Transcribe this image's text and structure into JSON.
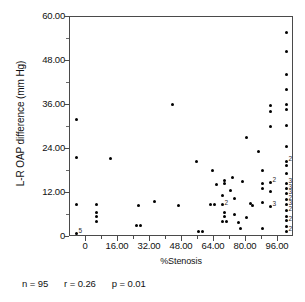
{
  "figure": {
    "title": "",
    "stats": {
      "n_label": "n = 95",
      "r_label": "r = 0.26",
      "p_label": "p = 0.01"
    }
  },
  "chart_data": {
    "type": "scatter",
    "title": "",
    "xlabel": "%Stenosis",
    "ylabel": "L-R OAP difference (mm Hg)",
    "xlim": [
      -8,
      104
    ],
    "ylim": [
      0,
      60
    ],
    "grid": false,
    "legend": "none",
    "xticks": [
      0,
      16,
      32,
      48,
      64,
      80,
      96
    ],
    "xtick_labels": [
      "0",
      "16.00",
      "32.00",
      "48.00",
      "64.00",
      "80.00",
      "96.00"
    ],
    "yticks": [
      0,
      12,
      24,
      36,
      48,
      60
    ],
    "ytick_labels": [
      "0",
      "12.00",
      "24.00",
      "36.00",
      "48.00",
      "60.00"
    ],
    "n": 95,
    "r": 0.26,
    "p": 0.01,
    "points": [
      {
        "x": -5,
        "y": 32.0
      },
      {
        "x": -5,
        "y": 21.6
      },
      {
        "x": -5,
        "y": 8.8
      },
      {
        "x": -5,
        "y": 1.0,
        "count": 5,
        "label": "5"
      },
      {
        "x": 5,
        "y": 9.0
      },
      {
        "x": 5,
        "y": 6.8
      },
      {
        "x": 5,
        "y": 5.6
      },
      {
        "x": 5,
        "y": 4.2
      },
      {
        "x": 12,
        "y": 21.5
      },
      {
        "x": 26,
        "y": 8.6
      },
      {
        "x": 25,
        "y": 3.2
      },
      {
        "x": 27,
        "y": 3.2
      },
      {
        "x": 34,
        "y": 9.8
      },
      {
        "x": 43,
        "y": 36.1
      },
      {
        "x": 46,
        "y": 8.6
      },
      {
        "x": 55,
        "y": 20.5
      },
      {
        "x": 56,
        "y": 1.5
      },
      {
        "x": 58,
        "y": 1.5
      },
      {
        "x": 62,
        "y": 8.8
      },
      {
        "x": 64,
        "y": 8.8
      },
      {
        "x": 63,
        "y": 18.2
      },
      {
        "x": 65,
        "y": 14.2
      },
      {
        "x": 69,
        "y": 15.4
      },
      {
        "x": 69,
        "y": 14.6
      },
      {
        "x": 68,
        "y": 11.4
      },
      {
        "x": 68,
        "y": 8.8,
        "count": 2,
        "label": "2"
      },
      {
        "x": 69,
        "y": 6.6
      },
      {
        "x": 69,
        "y": 5.6
      },
      {
        "x": 68,
        "y": 4.2
      },
      {
        "x": 70,
        "y": 4.2
      },
      {
        "x": 72,
        "y": 12.8
      },
      {
        "x": 73,
        "y": 16.2
      },
      {
        "x": 74,
        "y": 10.4
      },
      {
        "x": 74,
        "y": 6.2
      },
      {
        "x": 76,
        "y": 4.0
      },
      {
        "x": 77,
        "y": 2.2
      },
      {
        "x": 78,
        "y": 15.2
      },
      {
        "x": 80,
        "y": 27.2
      },
      {
        "x": 80,
        "y": 5.2
      },
      {
        "x": 82,
        "y": 9.2
      },
      {
        "x": 83,
        "y": 8.6
      },
      {
        "x": 86,
        "y": 23.4
      },
      {
        "x": 88,
        "y": 18.2
      },
      {
        "x": 88,
        "y": 14.6
      },
      {
        "x": 88,
        "y": 13.2
      },
      {
        "x": 88,
        "y": 9.4
      },
      {
        "x": 88,
        "y": 2.2
      },
      {
        "x": 92,
        "y": 35.8
      },
      {
        "x": 92,
        "y": 34.2
      },
      {
        "x": 92,
        "y": 30.2
      },
      {
        "x": 92,
        "y": 15.0,
        "count": 2,
        "label": "2"
      },
      {
        "x": 92,
        "y": 12.4
      },
      {
        "x": 92,
        "y": 8.4,
        "count": 3,
        "label": "3"
      },
      {
        "x": 100,
        "y": 55.8
      },
      {
        "x": 100,
        "y": 50.6
      },
      {
        "x": 100,
        "y": 44.4
      },
      {
        "x": 100,
        "y": 40.2
      },
      {
        "x": 100,
        "y": 36.2
      },
      {
        "x": 100,
        "y": 34.8
      },
      {
        "x": 100,
        "y": 30.4
      },
      {
        "x": 100,
        "y": 24.6
      },
      {
        "x": 100,
        "y": 20.6,
        "count": 2,
        "label": "2"
      },
      {
        "x": 100,
        "y": 19.4
      },
      {
        "x": 100,
        "y": 17.4
      },
      {
        "x": 100,
        "y": 14.6,
        "count": 3,
        "label": "3"
      },
      {
        "x": 100,
        "y": 13.2,
        "count": 3,
        "label": "3"
      },
      {
        "x": 100,
        "y": 11.8,
        "count": 3,
        "label": "3"
      },
      {
        "x": 100,
        "y": 10.2,
        "count": 2,
        "label": "2"
      },
      {
        "x": 100,
        "y": 8.8,
        "count": 3,
        "label": "3"
      },
      {
        "x": 100,
        "y": 7.2,
        "count": 2,
        "label": "2"
      },
      {
        "x": 100,
        "y": 5.6
      },
      {
        "x": 100,
        "y": 4.4,
        "count": 2,
        "label": "2"
      },
      {
        "x": 100,
        "y": 3.0
      },
      {
        "x": 100,
        "y": 1.6,
        "count": 2,
        "label": "2"
      }
    ]
  }
}
